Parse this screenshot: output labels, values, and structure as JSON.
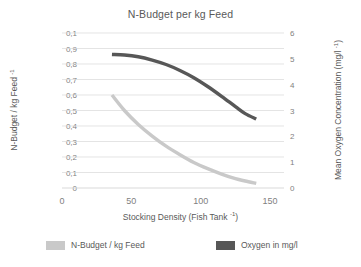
{
  "chart_data": {
    "type": "line",
    "title": "N-Budget per kg Feed",
    "xlabel": "Stocking Density (Fish Tank ⁻¹)",
    "xlabel_base": "Stocking Density (Fish Tank ",
    "xlabel_sup": "-1",
    "xlabel_tail": ")",
    "ylabel_left_base": "N-Budget / kg Feed ",
    "ylabel_left_sup": "-1",
    "ylabel_right_base": "Mean Oxygen Concentration (mg/l ",
    "ylabel_right_sup": "-1",
    "ylabel_right_tail": ")",
    "xlim": [
      0,
      160
    ],
    "xticks": [
      0,
      50,
      100,
      150
    ],
    "xticklabels": [
      "0",
      "50",
      "100",
      "150"
    ],
    "ylim_left": [
      0,
      1.0
    ],
    "yticks_left": [
      0,
      0.1,
      0.2,
      0.3,
      0.4,
      0.5,
      0.6,
      0.7,
      0.8,
      0.9,
      1.0
    ],
    "yticklabels_left": [
      "0",
      "0,1",
      "0,2",
      "0,3",
      "0,4",
      "0,5",
      "0,6",
      "0,7",
      "0,8",
      "0,9",
      "0,1"
    ],
    "ylim_right": [
      0,
      6
    ],
    "yticks_right": [
      0,
      1,
      2,
      3,
      4,
      5,
      6
    ],
    "yticklabels_right": [
      "0",
      "1",
      "2",
      "3",
      "4",
      "5",
      "6"
    ],
    "grid": true,
    "grid_color": "#d9d9d9",
    "legend_position": "bottom",
    "series": [
      {
        "name": "N-Budget / kg Feed",
        "color": "#c9c9c9",
        "axis": "left",
        "x": [
          36,
          45,
          55,
          65,
          75,
          85,
          95,
          105,
          115,
          125,
          132,
          140
        ],
        "values": [
          0.6,
          0.5,
          0.41,
          0.335,
          0.27,
          0.215,
          0.165,
          0.125,
          0.09,
          0.06,
          0.045,
          0.03
        ]
      },
      {
        "name": "Oxygen in mg/l",
        "color": "#575757",
        "axis": "right",
        "x": [
          36,
          45,
          55,
          65,
          75,
          85,
          95,
          105,
          115,
          125,
          132,
          140
        ],
        "values": [
          5.17,
          5.15,
          5.08,
          4.95,
          4.78,
          4.55,
          4.27,
          3.93,
          3.55,
          3.15,
          2.88,
          2.67
        ]
      }
    ]
  },
  "legend": {
    "items": [
      {
        "label": "N-Budget / kg Feed",
        "color": "#c9c9c9"
      },
      {
        "label": "Oxygen in mg/l",
        "color": "#575757"
      }
    ]
  }
}
